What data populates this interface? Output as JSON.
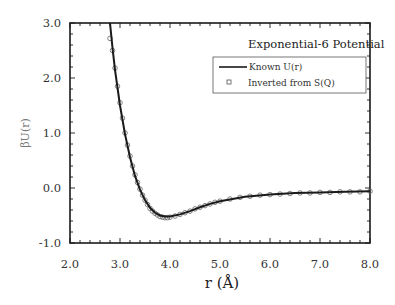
{
  "chart_data": {
    "type": "line",
    "title": "Exponential-6  Potential",
    "xlabel": "r (Å)",
    "ylabel": "βU(r)",
    "xlim": [
      2.0,
      8.0
    ],
    "ylim": [
      -1.0,
      3.0
    ],
    "x_ticks": [
      "2.0",
      "3.0",
      "4.0",
      "5.0",
      "6.0",
      "7.0",
      "8.0"
    ],
    "y_ticks": [
      "3.0",
      "2.0",
      "1.0",
      "0.0",
      "-1.0"
    ],
    "grid": false,
    "legend_position": "upper right",
    "legend": [
      {
        "label": "Known U(r)",
        "style": "solid line"
      },
      {
        "label": "Inverted from S(Q)",
        "style": "open circle markers"
      }
    ],
    "series": [
      {
        "name": "Known U(r)",
        "x": [
          2.8,
          2.85,
          2.9,
          3.0,
          3.1,
          3.2,
          3.3,
          3.4,
          3.5,
          3.6,
          3.7,
          3.8,
          3.9,
          4.0,
          4.2,
          4.4,
          4.6,
          4.8,
          5.0,
          5.5,
          6.0,
          6.5,
          7.0,
          7.5,
          8.0
        ],
        "y": [
          3.0,
          2.55,
          2.15,
          1.5,
          0.98,
          0.56,
          0.22,
          -0.03,
          -0.22,
          -0.36,
          -0.45,
          -0.5,
          -0.52,
          -0.52,
          -0.48,
          -0.42,
          -0.35,
          -0.29,
          -0.24,
          -0.16,
          -0.12,
          -0.09,
          -0.08,
          -0.07,
          -0.06
        ]
      },
      {
        "name": "Inverted from S(Q)",
        "x": [
          2.8,
          2.85,
          2.9,
          2.95,
          3.0,
          3.05,
          3.1,
          3.15,
          3.2,
          3.25,
          3.3,
          3.35,
          3.4,
          3.45,
          3.5,
          3.55,
          3.6,
          3.65,
          3.7,
          3.75,
          3.8,
          3.85,
          3.9,
          3.95,
          4.0,
          4.1,
          4.2,
          4.3,
          4.4,
          4.5,
          4.6,
          4.7,
          4.8,
          4.9,
          5.0,
          5.2,
          5.4,
          5.6,
          5.8,
          6.0,
          6.2,
          6.4,
          6.6,
          6.8,
          7.0,
          7.2,
          7.4,
          7.6,
          7.8,
          8.0
        ],
        "y": [
          2.72,
          2.5,
          2.18,
          1.85,
          1.55,
          1.27,
          1.0,
          0.78,
          0.58,
          0.4,
          0.24,
          0.1,
          -0.02,
          -0.13,
          -0.22,
          -0.3,
          -0.37,
          -0.42,
          -0.46,
          -0.49,
          -0.52,
          -0.53,
          -0.54,
          -0.54,
          -0.53,
          -0.51,
          -0.48,
          -0.45,
          -0.42,
          -0.38,
          -0.35,
          -0.32,
          -0.29,
          -0.26,
          -0.24,
          -0.2,
          -0.17,
          -0.15,
          -0.13,
          -0.12,
          -0.11,
          -0.1,
          -0.09,
          -0.09,
          -0.08,
          -0.08,
          -0.07,
          -0.07,
          -0.07,
          -0.06
        ]
      }
    ]
  },
  "legend": {
    "item1": "Known U(r)",
    "item2": "Inverted from S(Q)"
  }
}
